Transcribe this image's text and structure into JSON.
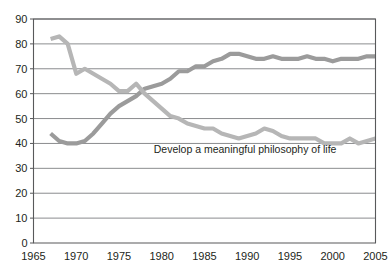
{
  "chart_data": {
    "type": "line",
    "title": "",
    "subtitle": "",
    "xlabel": "",
    "ylabel": "",
    "xlim": [
      1965,
      2005
    ],
    "ylim": [
      0,
      90
    ],
    "grid": "horizontal",
    "legend_position": "inline-annotation",
    "y_ticks": [
      "0",
      "10",
      "20",
      "30",
      "40",
      "50",
      "60",
      "70",
      "80",
      "90"
    ],
    "x_ticks": [
      "1965",
      "1970",
      "1975",
      "1980",
      "1985",
      "1990",
      "1995",
      "2000",
      "2005"
    ],
    "annotations": [
      {
        "text": "Develop a meaningful philosophy of life",
        "x": 1980,
        "y": 36
      }
    ],
    "series": [
      {
        "name": "Be very well off financially",
        "color": "#9b9b9b",
        "x": [
          1967,
          1968,
          1969,
          1970,
          1971,
          1972,
          1973,
          1974,
          1975,
          1976,
          1977,
          1978,
          1979,
          1980,
          1981,
          1982,
          1983,
          1984,
          1985,
          1986,
          1987,
          1988,
          1989,
          1990,
          1991,
          1992,
          1993,
          1994,
          1995,
          1996,
          1997,
          1998,
          1999,
          2000,
          2001,
          2002,
          2003,
          2004,
          2005
        ],
        "values": [
          44,
          41,
          40,
          40,
          41,
          44,
          48,
          52,
          55,
          57,
          59,
          62,
          63,
          64,
          66,
          69,
          69,
          71,
          71,
          73,
          74,
          76,
          76,
          75,
          74,
          74,
          75,
          74,
          74,
          74,
          75,
          74,
          74,
          73,
          74,
          74,
          74,
          75,
          75
        ]
      },
      {
        "name": "Develop a meaningful philosophy of life",
        "color": "#b6b6b6",
        "x": [
          1967,
          1968,
          1969,
          1970,
          1971,
          1972,
          1973,
          1974,
          1975,
          1976,
          1977,
          1978,
          1979,
          1980,
          1981,
          1982,
          1983,
          1984,
          1985,
          1986,
          1987,
          1988,
          1989,
          1990,
          1991,
          1992,
          1993,
          1994,
          1995,
          1996,
          1997,
          1998,
          1999,
          2000,
          2001,
          2002,
          2003,
          2004,
          2005
        ],
        "values": [
          82,
          83,
          80,
          68,
          70,
          68,
          66,
          64,
          61,
          61,
          64,
          60,
          57,
          54,
          51,
          50,
          48,
          47,
          46,
          46,
          44,
          43,
          42,
          43,
          44,
          46,
          45,
          43,
          42,
          42,
          42,
          42,
          40,
          40,
          40,
          42,
          40,
          41,
          42
        ]
      }
    ]
  },
  "axes": {
    "y_axis_name": "percent-axis",
    "x_axis_name": "year-axis"
  }
}
